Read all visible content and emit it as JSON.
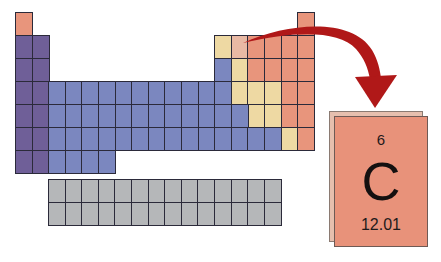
{
  "colors": {
    "nonmetal": "#e8957c",
    "metalloid": "#eed9a3",
    "highlight": "#e9b9a4",
    "alkali": "#6f5f98",
    "metal": "#7b87bf",
    "lanthanide": "#b5b7b9",
    "arrow": "#b01818",
    "grid_line": "#2b2a3a"
  },
  "grid": {
    "origin_x": 15,
    "origin_y": 12,
    "col_width": 16.6,
    "row_height": 23
  },
  "main_table": [
    {
      "row": 1,
      "cells": [
        {
          "col": 1,
          "type": "nonmetal"
        },
        {
          "col": 18,
          "type": "nonmetal"
        }
      ]
    },
    {
      "row": 2,
      "cells": [
        {
          "col": 1,
          "type": "alkali"
        },
        {
          "col": 2,
          "type": "alkali"
        },
        {
          "col": 13,
          "type": "metalloid"
        },
        {
          "col": 14,
          "type": "highlight"
        },
        {
          "col": 15,
          "type": "nonmetal"
        },
        {
          "col": 16,
          "type": "nonmetal"
        },
        {
          "col": 17,
          "type": "nonmetal"
        },
        {
          "col": 18,
          "type": "nonmetal"
        }
      ]
    },
    {
      "row": 3,
      "cells": [
        {
          "col": 1,
          "type": "alkali"
        },
        {
          "col": 2,
          "type": "alkali"
        },
        {
          "col": 13,
          "type": "metal"
        },
        {
          "col": 14,
          "type": "metalloid"
        },
        {
          "col": 15,
          "type": "nonmetal"
        },
        {
          "col": 16,
          "type": "nonmetal"
        },
        {
          "col": 17,
          "type": "nonmetal"
        },
        {
          "col": 18,
          "type": "nonmetal"
        }
      ]
    },
    {
      "row": 4,
      "range_metal": [
        3,
        13
      ],
      "cells": [
        {
          "col": 1,
          "type": "alkali"
        },
        {
          "col": 2,
          "type": "alkali"
        },
        {
          "col": 14,
          "type": "metalloid"
        },
        {
          "col": 15,
          "type": "metalloid"
        },
        {
          "col": 16,
          "type": "metalloid"
        },
        {
          "col": 17,
          "type": "nonmetal"
        },
        {
          "col": 18,
          "type": "nonmetal"
        }
      ]
    },
    {
      "row": 5,
      "range_metal": [
        3,
        14
      ],
      "cells": [
        {
          "col": 1,
          "type": "alkali"
        },
        {
          "col": 2,
          "type": "alkali"
        },
        {
          "col": 15,
          "type": "metalloid"
        },
        {
          "col": 16,
          "type": "metalloid"
        },
        {
          "col": 17,
          "type": "nonmetal"
        },
        {
          "col": 18,
          "type": "nonmetal"
        }
      ]
    },
    {
      "row": 6,
      "range_metal": [
        3,
        16
      ],
      "cells": [
        {
          "col": 1,
          "type": "alkali"
        },
        {
          "col": 2,
          "type": "alkali"
        },
        {
          "col": 17,
          "type": "metalloid"
        },
        {
          "col": 18,
          "type": "nonmetal"
        }
      ]
    },
    {
      "row": 7,
      "range_metal": [
        3,
        6
      ],
      "cells": [
        {
          "col": 1,
          "type": "alkali"
        },
        {
          "col": 2,
          "type": "alkali"
        }
      ]
    }
  ],
  "lanthanides": {
    "origin_x": 48,
    "origin_y": 179,
    "cols": 14,
    "rows": 2,
    "col_width": 16.6,
    "row_height": 22.5
  },
  "element_card": {
    "atomic_number": "6",
    "symbol": "C",
    "atomic_mass": "12.01"
  }
}
